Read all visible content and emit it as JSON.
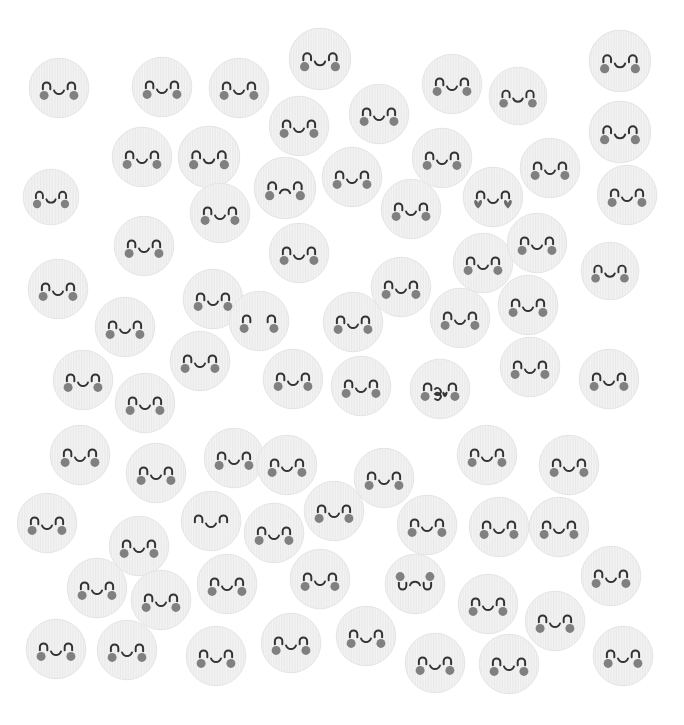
{
  "canvas": {
    "width": 684,
    "height": 725,
    "background": "#ffffff",
    "title": "kawaii-face-pattern"
  },
  "style": {
    "face_fill": "#f4f4f4",
    "face_fill_alt": "#efefef",
    "face_stroke": "#e4e4e4",
    "stripe_color": "#e9e9e9",
    "feature_color": "#333333",
    "cheek_color": "#808080",
    "heart_color": "#6e6e6e"
  },
  "legend": {
    "normal": "smiling face with n-eyes, u-mouth and round cheeks",
    "kiss": "kissing face with 3-mouth and heart",
    "heart_cheeks": "smiling face with heart-shaped cheeks",
    "frown": "frowning face with n-eyes and round cheeks",
    "no_mouth": "face with n-eyes and cheeks but no mouth",
    "no_cheeks": "smiling face without cheeks",
    "upside_down": "upside-down sad face with cheeks on top"
  },
  "faces": [
    {
      "id": 1,
      "x": 28,
      "y": 57,
      "r": 31,
      "type": "normal"
    },
    {
      "id": 2,
      "x": 131,
      "y": 56,
      "r": 31,
      "type": "normal"
    },
    {
      "id": 3,
      "x": 208,
      "y": 57,
      "r": 31,
      "type": "normal"
    },
    {
      "id": 4,
      "x": 288,
      "y": 27,
      "r": 32,
      "type": "normal"
    },
    {
      "id": 5,
      "x": 421,
      "y": 53,
      "r": 31,
      "type": "normal"
    },
    {
      "id": 6,
      "x": 488,
      "y": 66,
      "r": 30,
      "type": "normal"
    },
    {
      "id": 7,
      "x": 588,
      "y": 29,
      "r": 32,
      "type": "normal"
    },
    {
      "id": 8,
      "x": 268,
      "y": 95,
      "r": 31,
      "type": "normal"
    },
    {
      "id": 9,
      "x": 348,
      "y": 83,
      "r": 31,
      "type": "normal"
    },
    {
      "id": 10,
      "x": 588,
      "y": 100,
      "r": 32,
      "type": "normal"
    },
    {
      "id": 11,
      "x": 111,
      "y": 126,
      "r": 31,
      "type": "normal"
    },
    {
      "id": 12,
      "x": 177,
      "y": 125,
      "r": 32,
      "type": "normal"
    },
    {
      "id": 13,
      "x": 411,
      "y": 127,
      "r": 31,
      "type": "normal"
    },
    {
      "id": 14,
      "x": 519,
      "y": 137,
      "r": 31,
      "type": "normal"
    },
    {
      "id": 15,
      "x": 253,
      "y": 156,
      "r": 32,
      "type": "frown"
    },
    {
      "id": 16,
      "x": 321,
      "y": 146,
      "r": 31,
      "type": "normal"
    },
    {
      "id": 17,
      "x": 596,
      "y": 164,
      "r": 31,
      "type": "normal"
    },
    {
      "id": 18,
      "x": 22,
      "y": 168,
      "r": 29,
      "type": "normal"
    },
    {
      "id": 19,
      "x": 189,
      "y": 182,
      "r": 31,
      "type": "normal"
    },
    {
      "id": 20,
      "x": 380,
      "y": 178,
      "r": 31,
      "type": "normal"
    },
    {
      "id": 21,
      "x": 462,
      "y": 166,
      "r": 31,
      "type": "heart_cheeks"
    },
    {
      "id": 22,
      "x": 113,
      "y": 215,
      "r": 31,
      "type": "normal"
    },
    {
      "id": 23,
      "x": 268,
      "y": 222,
      "r": 31,
      "type": "normal"
    },
    {
      "id": 24,
      "x": 452,
      "y": 232,
      "r": 31,
      "type": "normal"
    },
    {
      "id": 25,
      "x": 506,
      "y": 212,
      "r": 31,
      "type": "normal"
    },
    {
      "id": 26,
      "x": 580,
      "y": 241,
      "r": 30,
      "type": "normal"
    },
    {
      "id": 27,
      "x": 27,
      "y": 258,
      "r": 31,
      "type": "normal"
    },
    {
      "id": 28,
      "x": 182,
      "y": 268,
      "r": 31,
      "type": "normal"
    },
    {
      "id": 29,
      "x": 370,
      "y": 256,
      "r": 31,
      "type": "normal"
    },
    {
      "id": 30,
      "x": 497,
      "y": 274,
      "r": 31,
      "type": "normal"
    },
    {
      "id": 31,
      "x": 94,
      "y": 296,
      "r": 31,
      "type": "normal"
    },
    {
      "id": 32,
      "x": 228,
      "y": 290,
      "r": 31,
      "type": "no_mouth"
    },
    {
      "id": 33,
      "x": 322,
      "y": 291,
      "r": 31,
      "type": "normal"
    },
    {
      "id": 34,
      "x": 429,
      "y": 287,
      "r": 31,
      "type": "normal"
    },
    {
      "id": 35,
      "x": 52,
      "y": 349,
      "r": 31,
      "type": "normal"
    },
    {
      "id": 36,
      "x": 169,
      "y": 330,
      "r": 31,
      "type": "normal"
    },
    {
      "id": 37,
      "x": 262,
      "y": 348,
      "r": 31,
      "type": "normal"
    },
    {
      "id": 38,
      "x": 330,
      "y": 355,
      "r": 31,
      "type": "normal"
    },
    {
      "id": 39,
      "x": 409,
      "y": 358,
      "r": 31,
      "type": "kiss"
    },
    {
      "id": 40,
      "x": 499,
      "y": 336,
      "r": 31,
      "type": "normal"
    },
    {
      "id": 41,
      "x": 578,
      "y": 348,
      "r": 31,
      "type": "normal"
    },
    {
      "id": 42,
      "x": 114,
      "y": 372,
      "r": 31,
      "type": "normal"
    },
    {
      "id": 43,
      "x": 49,
      "y": 424,
      "r": 31,
      "type": "normal"
    },
    {
      "id": 44,
      "x": 125,
      "y": 442,
      "r": 31,
      "type": "normal"
    },
    {
      "id": 45,
      "x": 203,
      "y": 427,
      "r": 31,
      "type": "normal"
    },
    {
      "id": 46,
      "x": 256,
      "y": 434,
      "r": 31,
      "type": "normal"
    },
    {
      "id": 47,
      "x": 353,
      "y": 447,
      "r": 31,
      "type": "normal"
    },
    {
      "id": 48,
      "x": 456,
      "y": 424,
      "r": 31,
      "type": "normal"
    },
    {
      "id": 49,
      "x": 538,
      "y": 434,
      "r": 31,
      "type": "normal"
    },
    {
      "id": 50,
      "x": 16,
      "y": 492,
      "r": 31,
      "type": "normal"
    },
    {
      "id": 51,
      "x": 180,
      "y": 490,
      "r": 31,
      "type": "no_cheeks"
    },
    {
      "id": 52,
      "x": 243,
      "y": 502,
      "r": 31,
      "type": "normal"
    },
    {
      "id": 53,
      "x": 303,
      "y": 480,
      "r": 31,
      "type": "normal"
    },
    {
      "id": 54,
      "x": 396,
      "y": 494,
      "r": 31,
      "type": "normal"
    },
    {
      "id": 55,
      "x": 468,
      "y": 496,
      "r": 31,
      "type": "normal"
    },
    {
      "id": 56,
      "x": 528,
      "y": 496,
      "r": 31,
      "type": "normal"
    },
    {
      "id": 57,
      "x": 108,
      "y": 515,
      "r": 31,
      "type": "normal"
    },
    {
      "id": 58,
      "x": 580,
      "y": 545,
      "r": 31,
      "type": "normal"
    },
    {
      "id": 59,
      "x": 66,
      "y": 557,
      "r": 31,
      "type": "normal"
    },
    {
      "id": 60,
      "x": 130,
      "y": 569,
      "r": 31,
      "type": "normal"
    },
    {
      "id": 61,
      "x": 196,
      "y": 553,
      "r": 31,
      "type": "normal"
    },
    {
      "id": 62,
      "x": 289,
      "y": 548,
      "r": 31,
      "type": "normal"
    },
    {
      "id": 63,
      "x": 384,
      "y": 553,
      "r": 31,
      "type": "upside_down"
    },
    {
      "id": 64,
      "x": 457,
      "y": 573,
      "r": 31,
      "type": "normal"
    },
    {
      "id": 65,
      "x": 524,
      "y": 590,
      "r": 31,
      "type": "normal"
    },
    {
      "id": 66,
      "x": 25,
      "y": 618,
      "r": 31,
      "type": "normal"
    },
    {
      "id": 67,
      "x": 96,
      "y": 619,
      "r": 31,
      "type": "normal"
    },
    {
      "id": 68,
      "x": 185,
      "y": 625,
      "r": 31,
      "type": "normal"
    },
    {
      "id": 69,
      "x": 260,
      "y": 612,
      "r": 31,
      "type": "normal"
    },
    {
      "id": 70,
      "x": 335,
      "y": 605,
      "r": 31,
      "type": "normal"
    },
    {
      "id": 71,
      "x": 404,
      "y": 632,
      "r": 31,
      "type": "normal"
    },
    {
      "id": 72,
      "x": 478,
      "y": 633,
      "r": 31,
      "type": "normal"
    },
    {
      "id": 73,
      "x": 592,
      "y": 625,
      "r": 31,
      "type": "normal"
    }
  ]
}
